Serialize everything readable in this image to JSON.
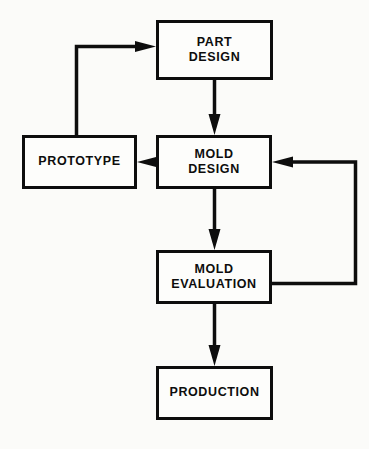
{
  "diagram": {
    "type": "flowchart",
    "background_color": "#fbfbf9",
    "line_color": "#0d0d0d",
    "box_fill_color": "#fdfdfb",
    "nodes": [
      {
        "id": "part-design",
        "label": "PART\nDESIGN",
        "x": 156,
        "y": 20,
        "width": 117,
        "height": 60
      },
      {
        "id": "prototype",
        "label": "PROTOTYPE",
        "x": 22,
        "y": 135,
        "width": 115,
        "height": 54
      },
      {
        "id": "mold-design",
        "label": "MOLD\nDESIGN",
        "x": 156,
        "y": 135,
        "width": 116,
        "height": 54
      },
      {
        "id": "mold-evaluation",
        "label": "MOLD\nEVALUATION",
        "x": 156,
        "y": 250,
        "width": 116,
        "height": 54
      },
      {
        "id": "production",
        "label": "PRODUCTION",
        "x": 156,
        "y": 366,
        "width": 117,
        "height": 54
      }
    ],
    "edges": [
      {
        "id": "part-design-to-mold-design",
        "from": "part-design",
        "to": "mold-design",
        "direction": "down"
      },
      {
        "id": "mold-design-to-prototype",
        "from": "mold-design",
        "to": "prototype",
        "direction": "left"
      },
      {
        "id": "prototype-to-part-design",
        "from": "prototype",
        "to": "part-design",
        "direction": "up-then-right"
      },
      {
        "id": "mold-design-to-mold-evaluation",
        "from": "mold-design",
        "to": "mold-evaluation",
        "direction": "down"
      },
      {
        "id": "mold-evaluation-to-mold-design",
        "from": "mold-evaluation",
        "to": "mold-design",
        "direction": "right-then-up-then-left"
      },
      {
        "id": "mold-evaluation-to-production",
        "from": "mold-evaluation",
        "to": "production",
        "direction": "down"
      }
    ]
  }
}
